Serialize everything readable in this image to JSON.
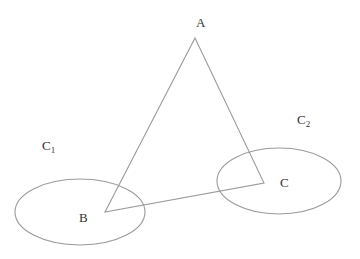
{
  "diagram": {
    "stroke_color": "#9a9a9a",
    "label_color": "#333333",
    "vertices": {
      "A": {
        "x": 195,
        "y": 38,
        "label": "A",
        "label_x": 196,
        "label_y": 27
      },
      "B": {
        "x": 105,
        "y": 212,
        "label": "B",
        "label_x": 79,
        "label_y": 222
      },
      "C": {
        "x": 264,
        "y": 183,
        "label": "C",
        "label_x": 280,
        "label_y": 187
      }
    },
    "ellipses": [
      {
        "name": "C",
        "subscript": "1",
        "cx": 80,
        "cy": 212,
        "rx": 65,
        "ry": 33,
        "label_x": 42,
        "label_y": 150
      },
      {
        "name": "C",
        "subscript": "2",
        "cx": 279,
        "cy": 181,
        "rx": 62,
        "ry": 33,
        "label_x": 297,
        "label_y": 124
      }
    ]
  }
}
